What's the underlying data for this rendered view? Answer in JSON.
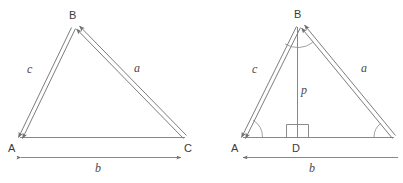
{
  "figure": {
    "stroke_color": "#7a7a7a",
    "text_color": "#3b3b3b",
    "label_color": "#4a4a4a",
    "background_color": "#ffffff"
  },
  "left_diagram": {
    "name": "triangle-vectors",
    "vertices": [
      {
        "id": "A",
        "label": "A",
        "x": 20,
        "y": 137
      },
      {
        "id": "B",
        "label": "B",
        "x": 73,
        "y": 27
      },
      {
        "id": "C",
        "label": "C",
        "x": 182,
        "y": 137
      }
    ],
    "side_labels": [
      {
        "id": "c",
        "label": "c",
        "x": 30,
        "y": 72
      },
      {
        "id": "a",
        "label": "a",
        "x": 136,
        "y": 71
      },
      {
        "id": "b",
        "label": "b",
        "x": 95,
        "y": 171
      }
    ],
    "vertex_label_positions": [
      {
        "id": "A",
        "x": 8,
        "y": 152
      },
      {
        "id": "B",
        "x": 69,
        "y": 19
      },
      {
        "id": "C",
        "x": 184,
        "y": 152
      }
    ]
  },
  "right_diagram": {
    "name": "triangle-altitude",
    "vertices": [
      {
        "id": "A",
        "label": "A",
        "x": 243,
        "y": 137
      },
      {
        "id": "B",
        "label": "B",
        "x": 298,
        "y": 26
      },
      {
        "id": "C",
        "label": "C",
        "x": 391,
        "y": 137
      },
      {
        "id": "D",
        "label": "D",
        "x": 297,
        "y": 137
      }
    ],
    "side_labels": [
      {
        "id": "c",
        "label": "c",
        "x": 255,
        "y": 72
      },
      {
        "id": "a",
        "label": "a",
        "x": 363,
        "y": 71
      },
      {
        "id": "p",
        "label": "p",
        "x": 302,
        "y": 93
      },
      {
        "id": "b",
        "label": "b",
        "x": 310,
        "y": 171
      }
    ],
    "vertex_label_positions": [
      {
        "id": "A",
        "x": 231,
        "y": 152
      },
      {
        "id": "B",
        "x": 294,
        "y": 18
      },
      {
        "id": "D",
        "x": 292,
        "y": 152
      }
    ],
    "markers": {
      "right_angle_at": "D",
      "angle_arcs": [
        "A",
        "B",
        "C"
      ]
    }
  }
}
